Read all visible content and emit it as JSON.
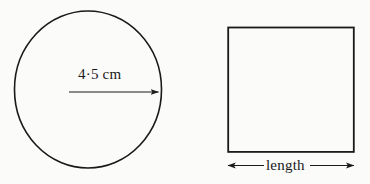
{
  "figure": {
    "background_color": "#fbfbfa",
    "ink_color": "#1a1a1a",
    "shapes": {
      "circle": {
        "name": "circle",
        "radius_label": "4·5 cm",
        "radius_arrow": {
          "name": "radius-arrow",
          "direction": "single-headed-right"
        }
      },
      "square": {
        "name": "square",
        "dimension_label": "length",
        "dimension_arrow": {
          "name": "length-arrow",
          "direction": "double-headed"
        }
      }
    }
  }
}
